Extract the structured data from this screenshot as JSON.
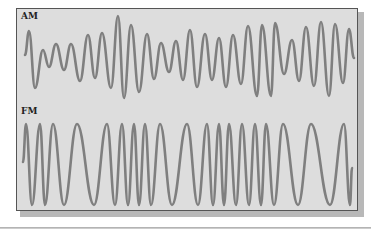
{
  "figure": {
    "panels": [
      {
        "label": "AM",
        "description": "Amplitude-modulated carrier wave",
        "points": [
          [
            25,
            55
          ],
          [
            29,
            31
          ],
          [
            35,
            88
          ],
          [
            43,
            50
          ],
          [
            49,
            67
          ],
          [
            56,
            44
          ],
          [
            64,
            70
          ],
          [
            71,
            44
          ],
          [
            80,
            81
          ],
          [
            88,
            35
          ],
          [
            95,
            78
          ],
          [
            102,
            33
          ],
          [
            111,
            88
          ],
          [
            118,
            16
          ],
          [
            124,
            98
          ],
          [
            131,
            25
          ],
          [
            139,
            92
          ],
          [
            147,
            34
          ],
          [
            154,
            79
          ],
          [
            161,
            43
          ],
          [
            169,
            72
          ],
          [
            176,
            41
          ],
          [
            183,
            80
          ],
          [
            190,
            30
          ],
          [
            197,
            87
          ],
          [
            205,
            34
          ],
          [
            212,
            80
          ],
          [
            219,
            38
          ],
          [
            226,
            87
          ],
          [
            233,
            35
          ],
          [
            241,
            84
          ],
          [
            248,
            26
          ],
          [
            257,
            96
          ],
          [
            262,
            25
          ],
          [
            271,
            96
          ],
          [
            275,
            23
          ],
          [
            284,
            74
          ],
          [
            292,
            40
          ],
          [
            299,
            81
          ],
          [
            306,
            27
          ],
          [
            314,
            86
          ],
          [
            321,
            22
          ],
          [
            329,
            96
          ],
          [
            335,
            24
          ],
          [
            343,
            83
          ],
          [
            349,
            29
          ],
          [
            354,
            58
          ]
        ]
      },
      {
        "label": "FM",
        "description": "Frequency-modulated carrier wave",
        "points": [
          [
            23,
            162
          ],
          [
            26,
            124
          ],
          [
            32,
            205
          ],
          [
            40,
            124
          ],
          [
            45,
            205
          ],
          [
            53,
            124
          ],
          [
            64,
            205
          ],
          [
            77,
            124
          ],
          [
            94,
            205
          ],
          [
            107,
            124
          ],
          [
            115,
            205
          ],
          [
            122,
            124
          ],
          [
            128,
            205
          ],
          [
            134,
            124
          ],
          [
            139,
            205
          ],
          [
            145,
            124
          ],
          [
            151,
            205
          ],
          [
            160,
            124
          ],
          [
            172,
            205
          ],
          [
            187,
            124
          ],
          [
            198,
            205
          ],
          [
            207,
            124
          ],
          [
            213,
            205
          ],
          [
            219,
            124
          ],
          [
            224,
            205
          ],
          [
            229,
            124
          ],
          [
            236,
            205
          ],
          [
            242,
            124
          ],
          [
            249,
            205
          ],
          [
            255,
            124
          ],
          [
            261,
            205
          ],
          [
            266,
            124
          ],
          [
            274,
            205
          ],
          [
            283,
            124
          ],
          [
            298,
            205
          ],
          [
            311,
            124
          ],
          [
            330,
            205
          ],
          [
            344,
            124
          ],
          [
            350,
            205
          ],
          [
            352,
            168
          ]
        ]
      }
    ],
    "colors": {
      "page_background": "#ffffff",
      "panel_background": "#dddddd",
      "panel_border": "#555555",
      "waveform_stroke": "#7f7f7f",
      "label_text": "#222222"
    }
  }
}
